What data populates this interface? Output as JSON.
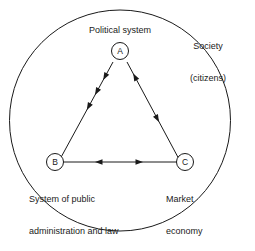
{
  "diagram": {
    "title_absent": true,
    "outer": {
      "name": "society-circle",
      "label_line1": "Society",
      "label_line2": "(citizens)"
    },
    "nodes": [
      {
        "id": "A",
        "letter": "A",
        "label": "Political system",
        "position": "top"
      },
      {
        "id": "B",
        "letter": "B",
        "label_line1": "System of public",
        "label_line2": "administration and law",
        "position": "bottom-left"
      },
      {
        "id": "C",
        "letter": "C",
        "label_line1": "Market",
        "label_line2": "economy",
        "position": "bottom-right"
      }
    ],
    "edges": [
      {
        "name": "edge-a-to-b",
        "from": "A",
        "to": "B",
        "direction": "one-way",
        "arrowhead_count": 3
      },
      {
        "name": "edge-a-c",
        "from": "A",
        "to": "C",
        "direction": "two-way-separate",
        "arrowhead_count": 2
      },
      {
        "name": "edge-b-c",
        "from": "B",
        "to": "C",
        "direction": "bidirectional",
        "arrowhead_count": 2
      }
    ],
    "colors": {
      "stroke": "#1a1a1a",
      "background": "#ffffff",
      "text": "#1a1a1a"
    }
  }
}
